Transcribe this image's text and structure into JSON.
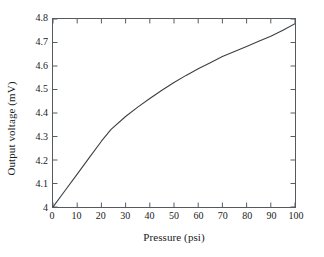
{
  "chart_data": {
    "type": "line",
    "title": "",
    "xlabel": "Pressure (psi)",
    "ylabel": "Output voltage (mV)",
    "xlim": [
      0,
      100
    ],
    "ylim": [
      4,
      4.8
    ],
    "xticks": [
      "0",
      "10",
      "20",
      "30",
      "40",
      "50",
      "60",
      "70",
      "80",
      "90",
      "100"
    ],
    "yticks": [
      "4",
      "4.1",
      "4.2",
      "4.3",
      "4.4",
      "4.5",
      "4.6",
      "4.7",
      "4.8"
    ],
    "grid": false,
    "legend": null,
    "line_color": "#3b3f44",
    "series": [
      {
        "name": "Output voltage",
        "x": [
          0,
          5,
          10,
          15,
          20,
          24,
          30,
          35,
          40,
          45,
          50,
          55,
          60,
          65,
          70,
          75,
          80,
          85,
          90,
          95,
          100
        ],
        "y": [
          4.0,
          4.07,
          4.14,
          4.21,
          4.28,
          4.33,
          4.385,
          4.425,
          4.462,
          4.497,
          4.53,
          4.56,
          4.588,
          4.614,
          4.64,
          4.662,
          4.683,
          4.705,
          4.727,
          4.752,
          4.78
        ]
      }
    ]
  }
}
